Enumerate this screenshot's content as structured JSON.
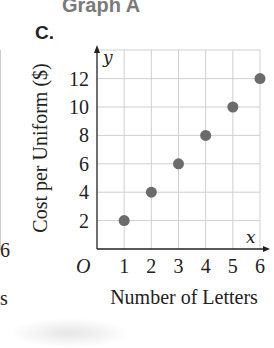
{
  "header": {
    "title": "Graph A",
    "option_label": "C."
  },
  "left_fragment": {
    "tick_label": "6",
    "axis_word_fragment": "s"
  },
  "chart_data": {
    "type": "scatter",
    "title": "",
    "xlabel": "Number of Letters",
    "ylabel": "Cost per Uniform ($)",
    "x_axis_symbol": "x",
    "y_axis_symbol": "y",
    "origin_label": "O",
    "x_ticks": [
      "1",
      "2",
      "3",
      "4",
      "5",
      "6"
    ],
    "y_ticks": [
      "2",
      "4",
      "6",
      "8",
      "10",
      "12"
    ],
    "xlim": [
      0,
      6
    ],
    "ylim": [
      0,
      13
    ],
    "grid": true,
    "series": [
      {
        "name": "Cost per Uniform",
        "x": [
          1,
          2,
          3,
          4,
          5,
          6
        ],
        "y": [
          2,
          4,
          6,
          8,
          10,
          12
        ]
      }
    ],
    "colors": {
      "point": "#6b6b6b",
      "grid": "#cfcfcf",
      "axis": "#222222"
    }
  }
}
